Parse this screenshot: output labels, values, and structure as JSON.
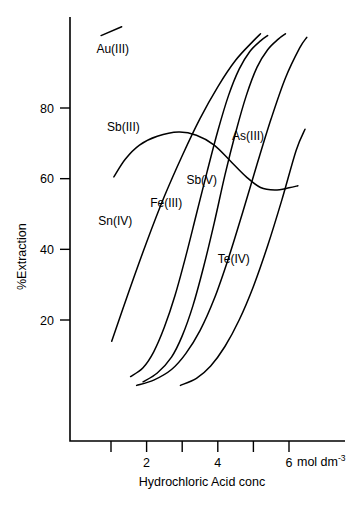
{
  "chart_data": {
    "type": "line",
    "title": "",
    "xlabel": "Hydrochloric Acid conc",
    "ylabel": "%Extraction",
    "x_unit": "mol dm",
    "x_unit_exponent": "-3",
    "xlim": [
      0,
      6.6
    ],
    "ylim": [
      0,
      102
    ],
    "grid": false,
    "legend": "inline-labels",
    "x_ticks": [
      1,
      2,
      3,
      4,
      5,
      6
    ],
    "x_tick_labels": [
      "",
      "2",
      "",
      "4",
      "",
      "6"
    ],
    "y_ticks": [
      20,
      40,
      60,
      80
    ],
    "y_tick_labels": [
      "20",
      "40",
      "60",
      "80"
    ],
    "series": [
      {
        "name": "Au(III)",
        "label": "Au(III)",
        "label_x": 1.05,
        "label_y": 95.5,
        "points": [
          [
            0.72,
            100.5
          ],
          [
            1.3,
            103.0
          ]
        ]
      },
      {
        "name": "Sn(IV)",
        "label": "Sn(IV)",
        "label_x": 1.12,
        "label_y": 47.0,
        "points": [
          [
            1.02,
            14.0
          ],
          [
            1.5,
            28.0
          ],
          [
            2.0,
            42.0
          ],
          [
            2.5,
            55.0
          ],
          [
            3.0,
            66.5
          ],
          [
            3.5,
            77.0
          ],
          [
            4.0,
            86.0
          ],
          [
            4.5,
            93.5
          ],
          [
            5.0,
            99.0
          ],
          [
            5.2,
            101.0
          ]
        ]
      },
      {
        "name": "Sb(III)",
        "label": "Sb(III)",
        "label_x": 1.35,
        "label_y": 73.5,
        "points": [
          [
            1.08,
            60.5
          ],
          [
            1.4,
            65.5
          ],
          [
            1.8,
            69.5
          ],
          [
            2.3,
            72.0
          ],
          [
            2.9,
            73.2
          ],
          [
            3.4,
            72.3
          ],
          [
            3.9,
            69.5
          ],
          [
            4.4,
            64.5
          ],
          [
            4.8,
            60.5
          ],
          [
            5.2,
            57.5
          ],
          [
            5.6,
            56.8
          ],
          [
            6.0,
            57.4
          ],
          [
            6.25,
            58.0
          ]
        ]
      },
      {
        "name": "Fe(III)",
        "label": "Fe(III)",
        "label_x": 2.55,
        "label_y": 52.0,
        "points": [
          [
            1.55,
            4.0
          ],
          [
            1.9,
            6.5
          ],
          [
            2.2,
            11.0
          ],
          [
            2.5,
            18.0
          ],
          [
            2.8,
            27.0
          ],
          [
            3.1,
            38.0
          ],
          [
            3.4,
            50.0
          ],
          [
            3.7,
            62.0
          ],
          [
            4.0,
            73.5
          ],
          [
            4.3,
            83.5
          ],
          [
            4.6,
            91.0
          ],
          [
            4.9,
            96.0
          ],
          [
            5.2,
            99.0
          ],
          [
            5.4,
            100.5
          ]
        ]
      },
      {
        "name": "Sb(V)",
        "label": "Sb(V)",
        "label_x": 3.55,
        "label_y": 58.5,
        "points": [
          [
            1.9,
            2.5
          ],
          [
            2.3,
            5.0
          ],
          [
            2.7,
            9.5
          ],
          [
            3.0,
            15.5
          ],
          [
            3.3,
            24.0
          ],
          [
            3.6,
            35.0
          ],
          [
            3.9,
            47.5
          ],
          [
            4.2,
            61.0
          ],
          [
            4.5,
            73.0
          ],
          [
            4.8,
            83.5
          ],
          [
            5.1,
            91.5
          ],
          [
            5.4,
            96.5
          ],
          [
            5.7,
            99.5
          ],
          [
            5.9,
            101.0
          ]
        ]
      },
      {
        "name": "As(III)",
        "label": "As(III)",
        "label_x": 4.85,
        "label_y": 71.0,
        "points": [
          [
            1.72,
            1.5
          ],
          [
            2.2,
            3.0
          ],
          [
            2.7,
            6.0
          ],
          [
            3.1,
            10.5
          ],
          [
            3.5,
            17.0
          ],
          [
            3.9,
            26.0
          ],
          [
            4.3,
            37.5
          ],
          [
            4.7,
            50.5
          ],
          [
            5.1,
            64.0
          ],
          [
            5.5,
            77.0
          ],
          [
            5.9,
            88.5
          ],
          [
            6.3,
            97.0
          ],
          [
            6.5,
            100.0
          ]
        ]
      },
      {
        "name": "Te(IV)",
        "label": "Te(IV)",
        "label_x": 4.45,
        "label_y": 36.0,
        "points": [
          [
            2.95,
            1.5
          ],
          [
            3.4,
            3.5
          ],
          [
            3.8,
            7.0
          ],
          [
            4.2,
            12.5
          ],
          [
            4.6,
            20.0
          ],
          [
            5.0,
            29.5
          ],
          [
            5.4,
            41.0
          ],
          [
            5.8,
            54.0
          ],
          [
            6.2,
            68.0
          ],
          [
            6.45,
            74.0
          ]
        ]
      }
    ]
  },
  "axes": {
    "y_axis_title": "%Extraction",
    "x_axis_title": "Hydrochloric Acid conc",
    "x_unit_text": "mol dm",
    "x_unit_sup": "-3"
  }
}
